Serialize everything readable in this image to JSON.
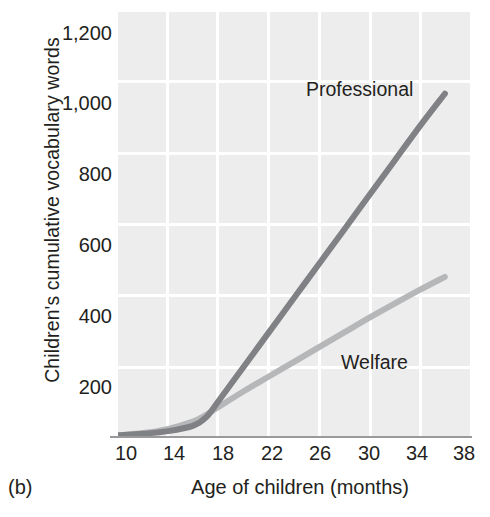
{
  "panel_id": "(b)",
  "chart_data": {
    "type": "line",
    "title": "",
    "xlabel": "Age of children (months)",
    "ylabel": "Children's cumulative vocabulary words",
    "xlim": [
      10,
      38
    ],
    "ylim": [
      0,
      1300
    ],
    "xticks": [
      10,
      14,
      18,
      22,
      26,
      30,
      34,
      38
    ],
    "xticklabels": [
      "10",
      "14",
      "18",
      "22",
      "26",
      "30",
      "34",
      "38"
    ],
    "yticks": [
      200,
      400,
      600,
      800,
      1000,
      1200
    ],
    "yticklabels": [
      "200",
      "400",
      "600",
      "800",
      "1,000",
      "1,200"
    ],
    "grid": true,
    "grid_style": "shaded-blocks",
    "legend_position": "inline-annotations",
    "series": [
      {
        "name": "Professional",
        "color": "#808184",
        "x": [
          10,
          12,
          14,
          16,
          17,
          18,
          20,
          22,
          24,
          26,
          28,
          30,
          32,
          34,
          36
        ],
        "values": [
          5,
          10,
          18,
          35,
          60,
          110,
          215,
          320,
          425,
          530,
          635,
          740,
          845,
          950,
          1050
        ]
      },
      {
        "name": "Welfare",
        "color": "#b6b7b9",
        "x": [
          10,
          12,
          14,
          16,
          17,
          18,
          20,
          22,
          24,
          26,
          28,
          30,
          32,
          34,
          36
        ],
        "values": [
          5,
          12,
          25,
          48,
          68,
          92,
          140,
          185,
          230,
          275,
          320,
          365,
          408,
          450,
          490
        ]
      }
    ],
    "annotations": [
      {
        "text": "Professional",
        "x": 27.5,
        "y": 1015
      },
      {
        "text": "Welfare",
        "x": 30.3,
        "y": 230
      }
    ]
  }
}
